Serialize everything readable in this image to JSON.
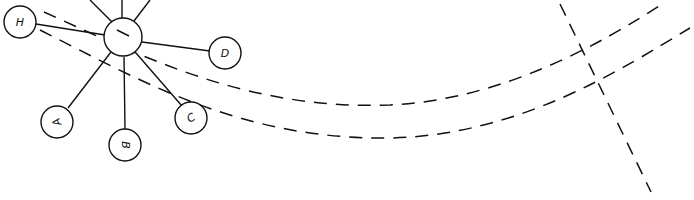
{
  "diagram": {
    "type": "hand-drawn star graph with dashed curves",
    "hub": {
      "label": "",
      "mark": "short slash"
    },
    "nodes": [
      {
        "id": "H",
        "label": "H"
      },
      {
        "id": "D",
        "label": "D"
      },
      {
        "id": "C",
        "label": "C"
      },
      {
        "id": "B",
        "label": "B"
      },
      {
        "id": "A",
        "label": "A"
      }
    ],
    "edges": [
      {
        "from": "hub",
        "to": "H"
      },
      {
        "from": "hub",
        "to": "D"
      },
      {
        "from": "hub",
        "to": "C"
      },
      {
        "from": "hub",
        "to": "B"
      },
      {
        "from": "hub",
        "to": "A"
      },
      {
        "from": "hub",
        "to": "off-canvas-up-left"
      },
      {
        "from": "hub",
        "to": "off-canvas-up"
      },
      {
        "from": "hub",
        "to": "off-canvas-up-right"
      }
    ],
    "dashed_paths": [
      {
        "name": "upper-dashed-curve"
      },
      {
        "name": "lower-dashed-curve"
      },
      {
        "name": "diagonal-dashed-line"
      }
    ],
    "colors": {
      "stroke": "#111111",
      "background": "#ffffff"
    }
  }
}
